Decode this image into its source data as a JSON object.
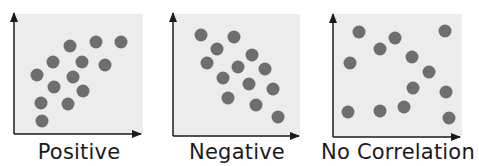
{
  "colors": {
    "background": "#ececec",
    "dot": "#6e6e6e",
    "axis": "#1a1a1a"
  },
  "chart_data": [
    {
      "type": "scatter",
      "title": "Positive",
      "xlabel": "",
      "ylabel": "",
      "grid": false,
      "x": [
        1.8,
        3.2,
        4.2,
        6.2,
        7.4,
        5.2,
        7.2,
        9.3,
        3.8,
        5.8,
        7.8,
        2.8,
        6.6,
        2.8
      ],
      "y": [
        8.0,
        6.0,
        7.2,
        8.2,
        8.2,
        5.4,
        5.9,
        5.9,
        4.6,
        4.9,
        6.9,
        3.3,
        3.3,
        1.5
      ],
      "points": [
        {
          "cx": 37,
          "cy": 75
        },
        {
          "cx": 53,
          "cy": 62
        },
        {
          "cx": 70,
          "cy": 46
        },
        {
          "cx": 96,
          "cy": 42
        },
        {
          "cx": 121,
          "cy": 42
        },
        {
          "cx": 82,
          "cy": 62
        },
        {
          "cx": 105,
          "cy": 65
        },
        {
          "cx": 73,
          "cy": 77
        },
        {
          "cx": 54,
          "cy": 87
        },
        {
          "cx": 83,
          "cy": 91
        },
        {
          "cx": 41,
          "cy": 103
        },
        {
          "cx": 68,
          "cy": 104
        },
        {
          "cx": 42,
          "cy": 121
        }
      ]
    },
    {
      "type": "scatter",
      "title": "Negative",
      "xlabel": "",
      "ylabel": "",
      "grid": false,
      "points": [
        {
          "cx": 201,
          "cy": 35
        },
        {
          "cx": 234,
          "cy": 37
        },
        {
          "cx": 217,
          "cy": 49
        },
        {
          "cx": 207,
          "cy": 63
        },
        {
          "cx": 252,
          "cy": 55
        },
        {
          "cx": 238,
          "cy": 67
        },
        {
          "cx": 265,
          "cy": 69
        },
        {
          "cx": 223,
          "cy": 78
        },
        {
          "cx": 249,
          "cy": 84
        },
        {
          "cx": 273,
          "cy": 89
        },
        {
          "cx": 228,
          "cy": 98
        },
        {
          "cx": 256,
          "cy": 105
        },
        {
          "cx": 278,
          "cy": 117
        }
      ]
    },
    {
      "type": "scatter",
      "title": "No Correlation",
      "xlabel": "",
      "ylabel": "",
      "grid": false,
      "points": [
        {
          "cx": 359,
          "cy": 32
        },
        {
          "cx": 395,
          "cy": 38
        },
        {
          "cx": 445,
          "cy": 31
        },
        {
          "cx": 380,
          "cy": 49
        },
        {
          "cx": 350,
          "cy": 63
        },
        {
          "cx": 412,
          "cy": 57
        },
        {
          "cx": 429,
          "cy": 72
        },
        {
          "cx": 413,
          "cy": 88
        },
        {
          "cx": 446,
          "cy": 92
        },
        {
          "cx": 348,
          "cy": 112
        },
        {
          "cx": 380,
          "cy": 111
        },
        {
          "cx": 404,
          "cy": 107
        },
        {
          "cx": 449,
          "cy": 118
        }
      ]
    }
  ],
  "labels": {
    "positive": "Positive",
    "negative": "Negative",
    "none": "No Correlation"
  }
}
